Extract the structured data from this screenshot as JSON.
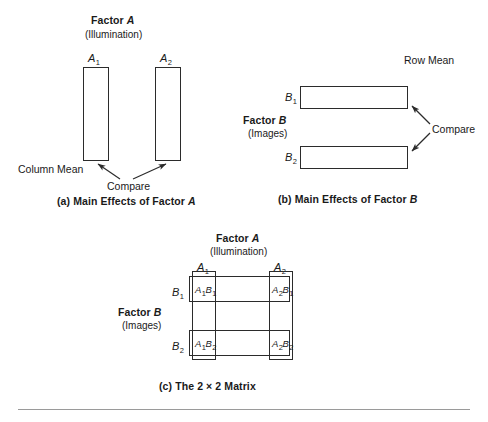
{
  "figure": {
    "panel_a": {
      "heading": "Factor A",
      "heading_main": "Factor",
      "heading_var": "A",
      "subheading": "(Illumination)",
      "col1_label_main": "A",
      "col1_label_sub": "1",
      "col2_label_main": "A",
      "col2_label_sub": "2",
      "side_label": "Column Mean",
      "compare_label": "Compare",
      "caption_prefix": "(a) Main Effects of Factor ",
      "caption_var": "A"
    },
    "panel_b": {
      "factor_main": "Factor",
      "factor_var": "B",
      "subheading": "(Images)",
      "row1_label_main": "B",
      "row1_label_sub": "1",
      "row2_label_main": "B",
      "row2_label_sub": "2",
      "side_label": "Row Mean",
      "compare_label": "Compare",
      "caption_prefix": "(b) Main Effects of Factor ",
      "caption_var": "B"
    },
    "panel_c": {
      "heading_main": "Factor",
      "heading_var": "A",
      "subheading": "(Illumination)",
      "factor_b_main": "Factor",
      "factor_b_var": "B",
      "factor_b_sub": "(Images)",
      "col1_label_main": "A",
      "col1_label_sub": "1",
      "col2_label_main": "A",
      "col2_label_sub": "2",
      "row1_label_main": "B",
      "row1_label_sub": "1",
      "row2_label_main": "B",
      "row2_label_sub": "2",
      "cells": [
        {
          "id": "a1b1",
          "v1": "A",
          "s1": "1",
          "v2": "B",
          "s2": "1"
        },
        {
          "id": "a2b1",
          "v1": "A",
          "s1": "2",
          "v2": "B",
          "s2": "1"
        },
        {
          "id": "a1b2",
          "v1": "A",
          "s1": "1",
          "v2": "B",
          "s2": "2"
        },
        {
          "id": "a2b2",
          "v1": "A",
          "s1": "2",
          "v2": "B",
          "s2": "2"
        }
      ],
      "caption": "(c) The 2 × 2 Matrix"
    },
    "colors": {
      "stroke": "#2b2b2b",
      "text": "#1a1a1a",
      "rule": "#9a9a9a",
      "background": "#ffffff"
    }
  }
}
